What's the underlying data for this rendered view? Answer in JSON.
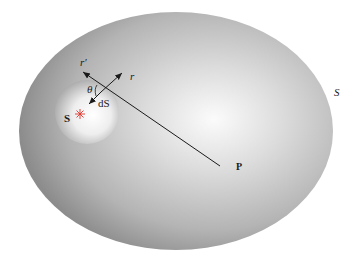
{
  "figure": {
    "labels": {
      "r_prime": "r′",
      "r": "r",
      "theta": "θ",
      "dS": "dS",
      "source": "S",
      "point": "P",
      "surface": "S"
    },
    "colors": {
      "ellipse_light": "#f4f4f4",
      "ellipse_dark": "#8f8f8f",
      "sphere_light": "#ffffff",
      "sphere_dark": "#9a9a9a",
      "line": "#1a1a1a",
      "source_star": "#e0342c"
    }
  }
}
